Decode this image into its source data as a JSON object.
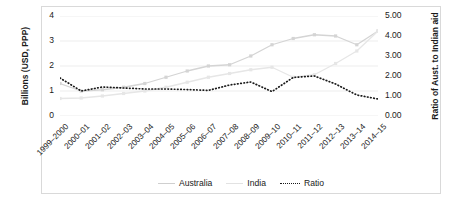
{
  "chart_data": {
    "type": "line",
    "title": "",
    "xlabel": "",
    "ylabel": "Billions (USD, PPP)",
    "y2label": "Ratio of Aust. to Indian aid",
    "categories": [
      "1999–2000",
      "2000–01",
      "2001–02",
      "2002–03",
      "2003–04",
      "2004–05",
      "2005–06",
      "2006–07",
      "2007–08",
      "2008–09",
      "2009–10",
      "2010–11",
      "2011–12",
      "2012–13",
      "2013–14",
      "2014–15"
    ],
    "ylim": [
      0,
      4
    ],
    "yticks": [
      "0",
      "1",
      "2",
      "3",
      "4"
    ],
    "y2lim": [
      0,
      5
    ],
    "y2ticks": [
      "0.00",
      "1.00",
      "2.00",
      "3.00",
      "4.00",
      "5.00"
    ],
    "grid": true,
    "legend_position": "bottom",
    "series": [
      {
        "name": "Australia",
        "axis": "left",
        "color": "#d4d4d4",
        "style": "solid",
        "values": [
          1.3,
          1.0,
          1.05,
          1.15,
          1.3,
          1.55,
          1.8,
          2.0,
          2.05,
          2.4,
          2.85,
          3.1,
          3.25,
          3.2,
          2.85,
          3.4
        ]
      },
      {
        "name": "India",
        "axis": "left",
        "color": "#e6e6e6",
        "style": "solid",
        "values": [
          0.7,
          0.72,
          0.8,
          0.9,
          1.0,
          1.15,
          1.35,
          1.55,
          1.7,
          1.85,
          1.95,
          1.55,
          1.65,
          2.1,
          2.6,
          3.4
        ]
      },
      {
        "name": "Ratio",
        "axis": "right",
        "color": "#1a1a1a",
        "style": "dotted",
        "values": [
          1.9,
          1.25,
          1.45,
          1.4,
          1.35,
          1.35,
          1.32,
          1.28,
          1.55,
          1.7,
          1.22,
          1.93,
          2.0,
          1.6,
          1.05,
          0.85
        ]
      }
    ],
    "legend": [
      "Australia",
      "India",
      "Ratio"
    ]
  }
}
